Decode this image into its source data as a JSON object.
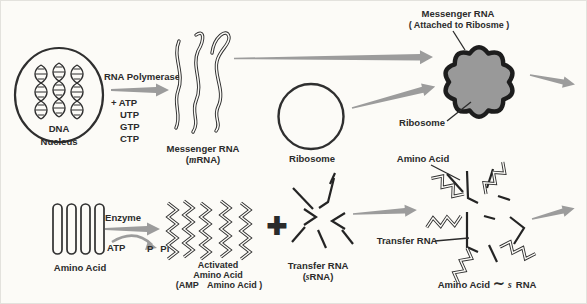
{
  "colors": {
    "background": "#fcfbf7",
    "ink": "#2b2b2b",
    "arrow_gray": "#9c9c9c",
    "ribosome_fill": "#9c9c9c",
    "complex_fill": "#999999"
  },
  "top_row": {
    "nucleus": {
      "organelle_label": "DNA",
      "caption": "Nucleus"
    },
    "transcription": {
      "enzyme": "RNA Polymerase",
      "substrates": [
        "+ ATP",
        "UTP",
        "GTP",
        "CTP"
      ]
    },
    "messenger_rna": {
      "title": "Messenger RNA",
      "abbr_open": "(",
      "abbr_italic": "m",
      "abbr_rest": "RNA)"
    },
    "ribosome": {
      "caption": "Ribosome"
    },
    "mrna_ribosome_complex": {
      "label_line1": "Messenger RNA",
      "label_line2": "( Attached to Ribosme )",
      "ribosome_label": "Ribosome"
    }
  },
  "bottom_row": {
    "amino_acids": {
      "caption": "Amino Acid",
      "atp": "ATP",
      "enzyme": "Enzyme",
      "product_p": "P",
      "product_pi": "Pi"
    },
    "activated_amino_acid": {
      "line1": "Activated",
      "line2": "Amino Acid",
      "line3_open": "(AMP",
      "line3_rest": "Amino Acid )"
    },
    "plus_sign": "+",
    "transfer_rna": {
      "title": "Transfer RNA",
      "abbr_open": "(",
      "abbr_italic": "s",
      "abbr_rest": "RNA)"
    },
    "aa_trna_complex": {
      "amino_acid_label": "Amino Acid",
      "trna_label": "Transfer RNA",
      "caption_prefix": "Amino Acid",
      "caption_tilde": "∼",
      "caption_italic": "s",
      "caption_rest": "RNA"
    }
  }
}
